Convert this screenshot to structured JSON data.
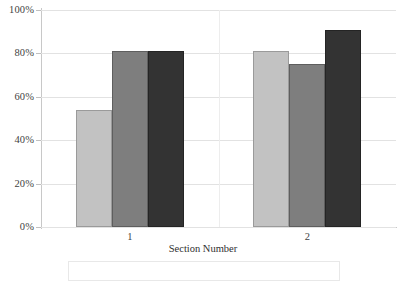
{
  "chart_data": {
    "type": "bar",
    "title": "",
    "subtitle": "",
    "xlabel": "Section Number",
    "ylabel": "",
    "categories": [
      "1",
      "2"
    ],
    "series": [
      {
        "name": "Series 1",
        "color": "#c2c2c2",
        "values": [
          54,
          81
        ]
      },
      {
        "name": "Series 2",
        "color": "#7e7e7e",
        "values": [
          81,
          75
        ]
      },
      {
        "name": "Series 3",
        "color": "#333333",
        "values": [
          81,
          91
        ]
      }
    ],
    "ylim": [
      0,
      100
    ],
    "yticks": [
      0,
      20,
      40,
      60,
      80,
      100
    ],
    "ytick_labels": [
      "0%",
      "20%",
      "40%",
      "60%",
      "80%",
      "100%"
    ],
    "value_format": "percent",
    "grid": {
      "horizontal": true,
      "vertical": true
    },
    "legend": {
      "position": "bottom",
      "visible": true,
      "clipped": true,
      "entries": []
    },
    "bar_gap_within_group": 0,
    "orientation": "vertical"
  },
  "axes": {
    "y_tick_labels": [
      "100%",
      "80%",
      "60%",
      "40%",
      "20%",
      "0%"
    ],
    "x_tick_labels": [
      "1",
      "2"
    ],
    "x_title": "Section Number"
  },
  "colors": {
    "series_light": "#c2c2c2",
    "series_medium": "#7e7e7e",
    "series_dark": "#333333",
    "gridline": "#e2e2e2",
    "axis": "#c8c8c8",
    "text": "#3f3f3f",
    "background": "#ffffff"
  }
}
